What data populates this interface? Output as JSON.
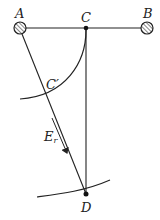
{
  "diagram": {
    "type": "geometry",
    "colors": {
      "line": "#222222",
      "hatch_fill": "#ffffff",
      "background": "#ffffff"
    },
    "points": {
      "A": {
        "label": "A",
        "x": 20,
        "y": 28,
        "kind": "hatched-support"
      },
      "B": {
        "label": "B",
        "x": 147,
        "y": 28,
        "kind": "hatched-support"
      },
      "C": {
        "label": "C",
        "x": 86,
        "y": 28,
        "kind": "dot"
      },
      "C_prime": {
        "label": "C′",
        "x": 47,
        "y": 92,
        "kind": "intersection"
      },
      "D": {
        "label": "D",
        "x": 86,
        "y": 194,
        "kind": "dot"
      }
    },
    "vector": {
      "label_main": "E",
      "label_sub": "r",
      "direction": "parallel to AD, pointing toward D"
    },
    "segments": [
      "A-B",
      "C-D",
      "A-D"
    ],
    "arcs": [
      "arc C to C′ (centered at A)",
      "arc through D"
    ]
  }
}
